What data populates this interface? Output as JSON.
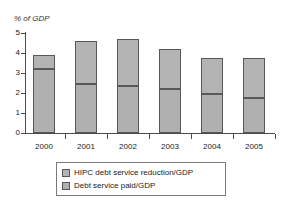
{
  "chart_data": {
    "type": "bar",
    "title": "",
    "subtitle": "",
    "xlabel": "",
    "ylabel": "% of GDP",
    "ylim": [
      0,
      5
    ],
    "yticks": [
      0,
      1,
      2,
      3,
      4,
      5
    ],
    "ytick_labels": [
      "0",
      "1",
      "2",
      "3",
      "4",
      "5"
    ],
    "grid": false,
    "stacked": true,
    "legend_position": "bottom",
    "categories": [
      "2000",
      "2001",
      "2002",
      "2003",
      "2004",
      "2005"
    ],
    "series": [
      {
        "name": "Debt service paid/GDP",
        "color": "#b0b0b0",
        "values": [
          3.2,
          2.45,
          2.35,
          2.2,
          1.95,
          1.75
        ]
      },
      {
        "name": "HIPC debt service reduction/GDP",
        "color": "#b4b4b4",
        "values": [
          0.7,
          2.15,
          2.35,
          2.0,
          1.8,
          2.0
        ]
      }
    ],
    "totals": [
      3.9,
      4.6,
      4.7,
      4.2,
      3.75,
      3.75
    ]
  },
  "axis": {
    "ylabel_text": "% of GDP"
  },
  "legend": {
    "entries": [
      {
        "label": "HIPC debt service reduction/GDP",
        "swatch": "#b4b4b4"
      },
      {
        "label": "Debt service paid/GDP",
        "swatch": "#b0b0b0"
      }
    ]
  },
  "colors": {
    "axis": "#4a4a4a",
    "bar_border": "#58585a",
    "background": "#ffffff",
    "text": "#1a1a1a"
  }
}
